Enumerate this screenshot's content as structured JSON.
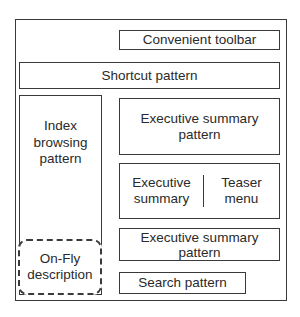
{
  "diagram": {
    "outer_frame": "",
    "toolbar": {
      "label": "Convenient toolbar"
    },
    "shortcut": {
      "label": "Shortcut pattern"
    },
    "index_browsing": {
      "label": "Index\nbrowsing\npattern"
    },
    "on_fly": {
      "label": "On-Fly\ndescription"
    },
    "executive_summary_top": {
      "label": "Executive summary\npattern"
    },
    "split": {
      "left": {
        "label": "Executive\nsummary"
      },
      "right": {
        "label": "Teaser\nmenu"
      }
    },
    "executive_summary_bottom": {
      "label": "Executive summary\npattern"
    },
    "search": {
      "label": "Search pattern"
    }
  },
  "colors": {
    "stroke": "#3a3a3a",
    "text": "#2a2a2a",
    "background": "#ffffff"
  }
}
